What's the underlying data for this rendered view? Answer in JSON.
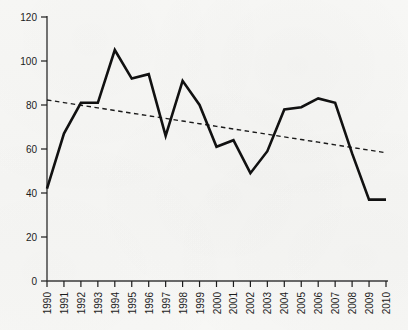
{
  "chart_data": {
    "type": "line",
    "title": "",
    "subtitle": "",
    "xlabel": "",
    "ylabel": "",
    "xlim": [
      1990,
      2010
    ],
    "ylim": [
      0,
      120
    ],
    "grid": false,
    "legend": "none",
    "x": [
      1990,
      1991,
      1992,
      1993,
      1994,
      1995,
      1996,
      1997,
      1998,
      1999,
      2000,
      2001,
      2002,
      2003,
      2004,
      2005,
      2006,
      2007,
      2008,
      2009,
      2010
    ],
    "categories": [
      "1990",
      "1991",
      "1992",
      "1993",
      "1994",
      "1995",
      "1996",
      "1997",
      "1998",
      "1999",
      "2000",
      "2001",
      "2002",
      "2003",
      "2004",
      "2005",
      "2006",
      "2007",
      "2008",
      "2009",
      "2010"
    ],
    "ytick_labels": [
      "0",
      "20",
      "40",
      "60",
      "80",
      "100",
      "120"
    ],
    "ytick_values": [
      0,
      20,
      40,
      60,
      80,
      100,
      120
    ],
    "series": [
      {
        "name": "observed",
        "style": "solid",
        "color": "#111111",
        "width": 2.6,
        "values": [
          42,
          67,
          81,
          81,
          105,
          92,
          94,
          66,
          91,
          80,
          61,
          64,
          49,
          59,
          78,
          79,
          83,
          81,
          58,
          37,
          37
        ]
      },
      {
        "name": "linear-trend",
        "style": "dashed",
        "color": "#1a1a1a",
        "width": 1.4,
        "values": [
          82.3,
          81.1,
          79.9,
          78.7,
          77.5,
          76.3,
          75.1,
          73.9,
          72.7,
          71.5,
          70.3,
          69.1,
          67.9,
          66.7,
          65.5,
          64.3,
          63.1,
          61.9,
          60.7,
          59.5,
          58.3
        ]
      }
    ],
    "trend_endpoints": {
      "start_year": 1990,
      "start_value": 82.3,
      "end_year": 2010,
      "end_value": 58.3
    }
  },
  "axes": {
    "y_axis_name": "y-axis",
    "x_axis_name": "x-axis",
    "tick_color": "#1c1c1c"
  }
}
